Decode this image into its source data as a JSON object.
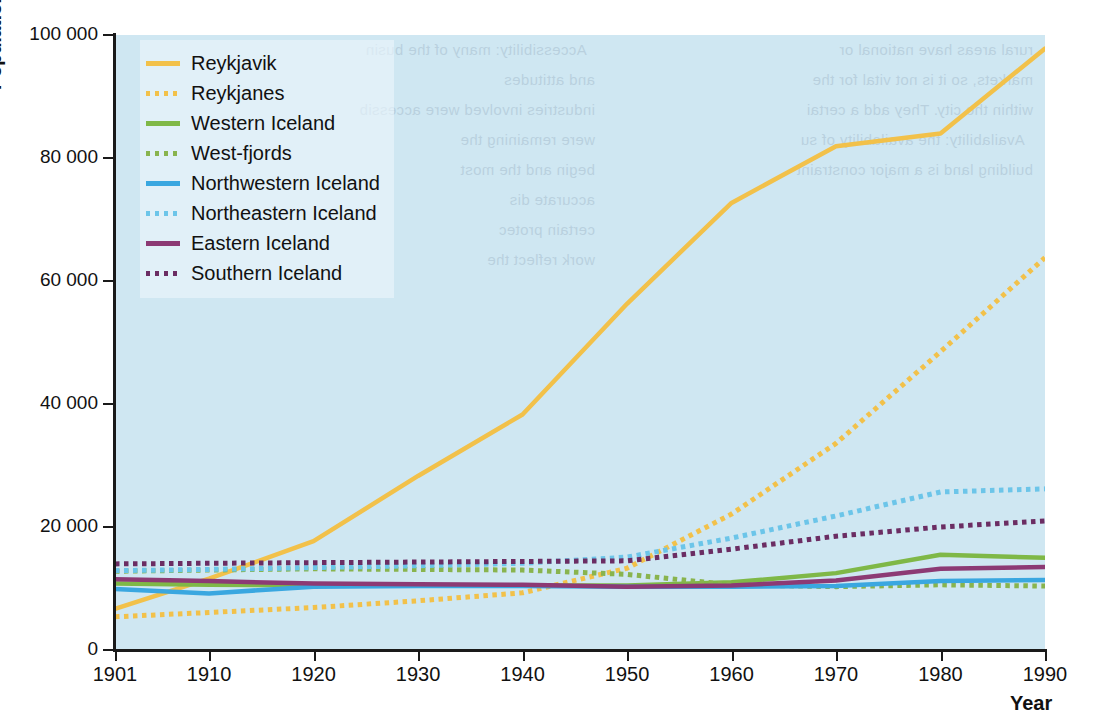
{
  "chart_data": {
    "type": "line",
    "title": "",
    "xlabel": "Year",
    "ylabel": "Population",
    "xlim": [
      1901,
      1990
    ],
    "ylim": [
      0,
      100000
    ],
    "grid": false,
    "legend_position": "top-left inside plot",
    "x": [
      1901,
      1910,
      1920,
      1930,
      1940,
      1950,
      1960,
      1970,
      1980,
      1990
    ],
    "xticks": [
      "1901",
      "1910",
      "1920",
      "1930",
      "1940",
      "1950",
      "1960",
      "1970",
      "1980",
      "1990"
    ],
    "yticks": [
      "0",
      "20 000",
      "40 000",
      "60 000",
      "80 000",
      "100 000"
    ],
    "ytick_values": [
      0,
      20000,
      40000,
      60000,
      80000,
      100000
    ],
    "series": [
      {
        "name": "Reykjavik",
        "color": "#f2c14a",
        "style": "solid",
        "values": [
          6700,
          11600,
          17700,
          28300,
          38300,
          56300,
          72700,
          81900,
          84000,
          97800
        ]
      },
      {
        "name": "Reykjanes",
        "color": "#f2c14a",
        "style": "dotted",
        "values": [
          5400,
          6100,
          6900,
          8000,
          9300,
          13300,
          22100,
          33600,
          48500,
          63800
        ]
      },
      {
        "name": "Western Iceland",
        "color": "#7fb847",
        "style": "solid",
        "values": [
          10800,
          10600,
          10500,
          10500,
          10500,
          10500,
          11000,
          12500,
          15500,
          15000
        ]
      },
      {
        "name": "West-fjords",
        "color": "#89b44e",
        "style": "dotted",
        "values": [
          12800,
          13000,
          13200,
          13100,
          13000,
          12300,
          10600,
          10300,
          10600,
          10400
        ]
      },
      {
        "name": "Northwestern Iceland",
        "color": "#3aa7e0",
        "style": "solid",
        "values": [
          9900,
          9200,
          10300,
          10400,
          10400,
          10300,
          10300,
          10400,
          11200,
          11400
        ]
      },
      {
        "name": "Northeastern Iceland",
        "color": "#6cc5e9",
        "style": "dotted",
        "values": [
          12900,
          13100,
          13400,
          13700,
          14100,
          15100,
          18200,
          21800,
          25700,
          26200
        ]
      },
      {
        "name": "Eastern Iceland",
        "color": "#8c3a74",
        "style": "solid",
        "values": [
          11500,
          11200,
          10800,
          10700,
          10600,
          10300,
          10500,
          11300,
          13200,
          13500
        ]
      },
      {
        "name": "Southern Iceland",
        "color": "#6b2d63",
        "style": "dotted",
        "values": [
          14000,
          14100,
          14200,
          14300,
          14400,
          14500,
          16400,
          18500,
          20000,
          21000
        ]
      }
    ]
  },
  "axes": {
    "y_title": "Population",
    "x_title": "Year"
  },
  "legend": {
    "items": [
      {
        "label": "Reykjavik",
        "color": "#f2c14a",
        "style": "solid"
      },
      {
        "label": "Reykjanes",
        "color": "#f2c14a",
        "style": "dotted"
      },
      {
        "label": "Western Iceland",
        "color": "#7fb847",
        "style": "solid"
      },
      {
        "label": "West-fjords",
        "color": "#89b44e",
        "style": "dotted"
      },
      {
        "label": "Northwestern Iceland",
        "color": "#3aa7e0",
        "style": "solid"
      },
      {
        "label": "Northeastern Iceland",
        "color": "#6cc5e9",
        "style": "dotted"
      },
      {
        "label": "Eastern Iceland",
        "color": "#8c3a74",
        "style": "solid"
      },
      {
        "label": "Southern Iceland",
        "color": "#6b2d63",
        "style": "dotted"
      }
    ]
  },
  "colors": {
    "plot_background": "#cfe7f2",
    "page_background": "#ffffff",
    "axis": "#1a1a1a"
  },
  "showthrough_text": {
    "left_column": "rural areas have national or\nmarkets, so it is not vital for the\nwithin the city. They add a certai\n  Availability: the availability of su\nbuilding land is a major constraint",
    "right_column": "  Accessibility: many of the busin\nand attitudes\nindustries involved were accessib\nwere remaining the\nbegin and the most\naccurate dis\ncertain protec\nwork reflect the"
  }
}
